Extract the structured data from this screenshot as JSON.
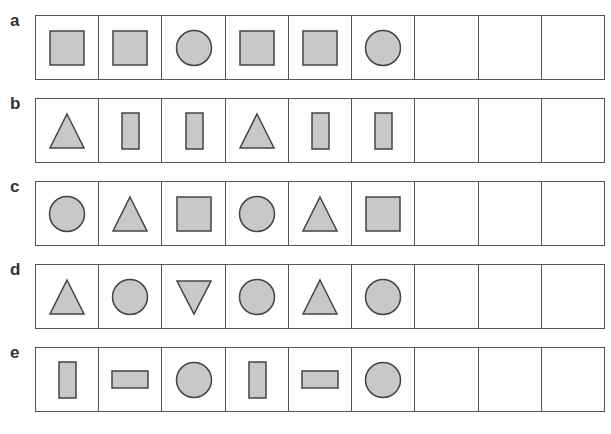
{
  "style": {
    "fill": "#c8c8c8",
    "stroke": "#444444"
  },
  "rows": [
    {
      "label": "a",
      "cells": [
        "square",
        "square",
        "circle",
        "square",
        "square",
        "circle",
        "",
        "",
        ""
      ]
    },
    {
      "label": "b",
      "cells": [
        "triangle-up",
        "tall-rect",
        "tall-rect",
        "triangle-up",
        "tall-rect",
        "tall-rect",
        "",
        "",
        ""
      ]
    },
    {
      "label": "c",
      "cells": [
        "circle",
        "triangle-up",
        "square",
        "circle",
        "triangle-up",
        "square",
        "",
        "",
        ""
      ]
    },
    {
      "label": "d",
      "cells": [
        "triangle-up",
        "circle",
        "triangle-down",
        "circle",
        "triangle-up",
        "circle",
        "",
        "",
        ""
      ]
    },
    {
      "label": "e",
      "cells": [
        "tall-rect",
        "wide-rect",
        "circle",
        "tall-rect",
        "wide-rect",
        "circle",
        "",
        "",
        ""
      ]
    }
  ]
}
